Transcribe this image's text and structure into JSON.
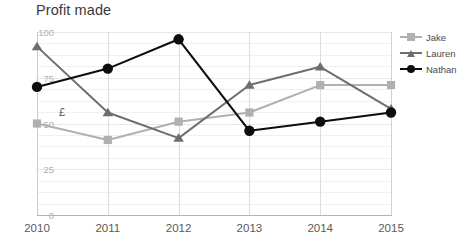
{
  "chart_data": {
    "type": "line",
    "title": "Profit made",
    "xlabel": "",
    "ylabel": "",
    "annotation": "£",
    "categories": [
      "2010",
      "2011",
      "2012",
      "2013",
      "2014",
      "2015"
    ],
    "ylim": [
      0,
      100
    ],
    "yticks": [
      0,
      25,
      50,
      75,
      100
    ],
    "grid": true,
    "legend_position": "right",
    "series": [
      {
        "name": "Jake",
        "color": "#b0b0b0",
        "marker": "square",
        "values": [
          50,
          41,
          51,
          56,
          71,
          71
        ]
      },
      {
        "name": "Lauren",
        "color": "#6e6e6e",
        "marker": "triangle",
        "values": [
          92,
          56,
          42,
          71,
          81,
          58
        ]
      },
      {
        "name": "Nathan",
        "color": "#0d0d0d",
        "marker": "circle",
        "values": [
          70,
          80,
          96,
          46,
          51,
          56
        ]
      }
    ]
  },
  "legend": {
    "items": [
      {
        "label": "Jake"
      },
      {
        "label": "Lauren"
      },
      {
        "label": "Nathan"
      }
    ]
  },
  "axis": {
    "y_labels": [
      "100",
      "75",
      "50",
      "25",
      "0"
    ],
    "x_labels": [
      "2010",
      "2011",
      "2012",
      "2013",
      "2014",
      "2015"
    ]
  }
}
